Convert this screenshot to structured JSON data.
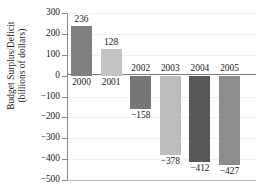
{
  "chart_data": {
    "type": "bar",
    "title": "",
    "xlabel": "",
    "ylabel": "Budget Surplus/Deficit (billions of dollars)",
    "ylabel_line1": "Budget Surplus/Deficit",
    "ylabel_line2": "(billions of dollars)",
    "categories": [
      "2000",
      "2001",
      "2002",
      "2003",
      "2004",
      "2005"
    ],
    "values": [
      236,
      128,
      -158,
      -378,
      -412,
      -427
    ],
    "value_labels": [
      "236",
      "128",
      "−158",
      "−378",
      "−412",
      "−427"
    ],
    "bar_colors": [
      "#7f7f7f",
      "#c4c4c4",
      "#767676",
      "#bdbdbd",
      "#575757",
      "#8c8c8c"
    ],
    "ylim": [
      -500,
      300
    ],
    "ytick_values": [
      300,
      200,
      100,
      0,
      -100,
      -200,
      -300,
      -400,
      -500
    ],
    "ytick_labels": [
      "300",
      "200",
      "100",
      "0",
      "−100",
      "−200",
      "−300",
      "−400",
      "−500"
    ],
    "grid": true,
    "legend": "none",
    "zero_line": 0
  }
}
